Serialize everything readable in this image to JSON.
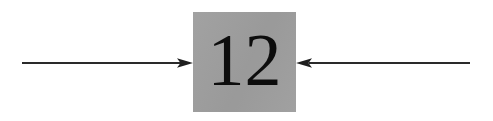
{
  "diagram": {
    "type": "flow-arrows",
    "canvas": {
      "width": 493,
      "height": 121,
      "background": "#ffffff"
    },
    "node": {
      "label": "12",
      "shape": "square",
      "fill_color": "#9e9e9e",
      "text_color": "#0d0d0d",
      "x": 193,
      "y": 12,
      "width": 103,
      "height": 100
    },
    "arrows": [
      {
        "name": "incoming-arrow-left",
        "direction": "right",
        "label": "",
        "color": "#2a2a2a",
        "start_x": 22,
        "end_x": 193,
        "y": 63
      },
      {
        "name": "incoming-arrow-right",
        "direction": "left",
        "label": "",
        "color": "#2a2a2a",
        "start_x": 470,
        "end_x": 296,
        "y": 63
      }
    ]
  }
}
